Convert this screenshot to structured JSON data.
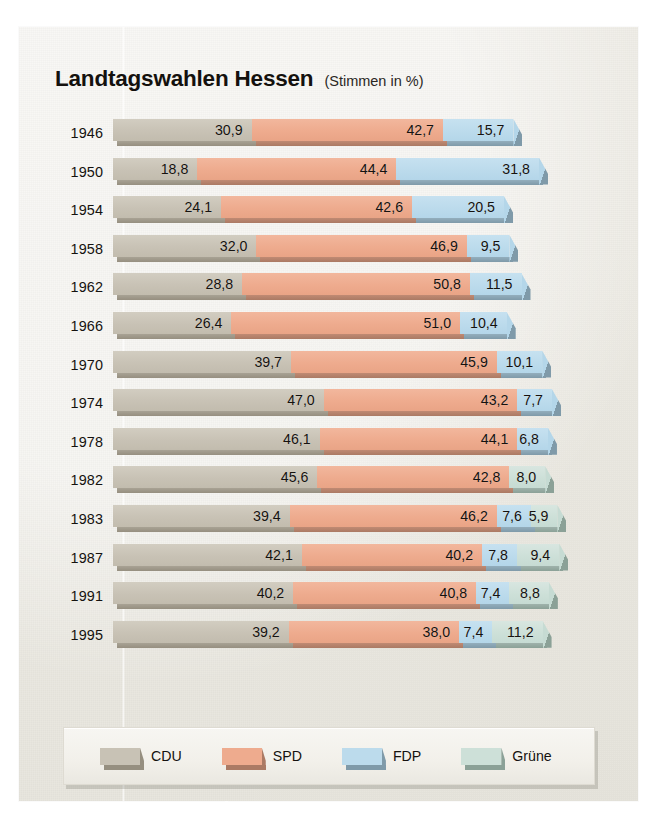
{
  "header": {
    "title": "Landtagswahlen Hessen",
    "subtitle": "(Stimmen in %)"
  },
  "legend": {
    "items": [
      {
        "label": "CDU",
        "key": "cdu",
        "color": "#c8c2b5"
      },
      {
        "label": "SPD",
        "key": "spd",
        "color": "#eeab8e"
      },
      {
        "label": "FDP",
        "key": "fdp",
        "color": "#bcdbec"
      },
      {
        "label": "Grüne",
        "key": "gru",
        "color": "#cde0d8"
      }
    ]
  },
  "chart_data": {
    "type": "bar",
    "orientation": "horizontal",
    "stacked": true,
    "title": "Landtagswahlen Hessen",
    "subtitle": "(Stimmen in %)",
    "xlabel": "",
    "ylabel": "",
    "xlim": [
      0,
      100
    ],
    "grid": false,
    "legend_position": "bottom",
    "value_format": "german-decimal-comma",
    "categories": [
      "1946",
      "1950",
      "1954",
      "1958",
      "1962",
      "1966",
      "1970",
      "1974",
      "1978",
      "1982",
      "1983",
      "1987",
      "1991",
      "1995"
    ],
    "series": [
      {
        "name": "CDU",
        "color": "#c8c2b5",
        "values": [
          30.9,
          18.8,
          24.1,
          32.0,
          28.8,
          26.4,
          39.7,
          47.0,
          46.1,
          45.6,
          39.4,
          42.1,
          40.2,
          39.2
        ]
      },
      {
        "name": "SPD",
        "color": "#eeab8e",
        "values": [
          42.7,
          44.4,
          42.6,
          46.9,
          50.8,
          51.0,
          45.9,
          43.2,
          44.1,
          42.8,
          46.2,
          40.2,
          40.8,
          38.0
        ]
      },
      {
        "name": "FDP",
        "color": "#bcdbec",
        "values": [
          15.7,
          31.8,
          20.5,
          9.5,
          11.5,
          10.4,
          10.1,
          7.7,
          6.8,
          null,
          7.6,
          7.8,
          7.4,
          7.4
        ]
      },
      {
        "name": "Grüne",
        "color": "#cde0d8",
        "values": [
          null,
          null,
          null,
          null,
          null,
          null,
          null,
          null,
          null,
          8.0,
          5.9,
          9.4,
          8.8,
          11.2
        ]
      }
    ],
    "rows": [
      {
        "year": "1946",
        "cells": [
          {
            "party": "CDU",
            "label": "30,9",
            "value": 30.9
          },
          {
            "party": "SPD",
            "label": "42,7",
            "value": 42.7
          },
          {
            "party": "FDP",
            "label": "15,7",
            "value": 15.7
          }
        ]
      },
      {
        "year": "1950",
        "cells": [
          {
            "party": "CDU",
            "label": "18,8",
            "value": 18.8
          },
          {
            "party": "SPD",
            "label": "44,4",
            "value": 44.4
          },
          {
            "party": "FDP",
            "label": "31,8",
            "value": 31.8
          }
        ]
      },
      {
        "year": "1954",
        "cells": [
          {
            "party": "CDU",
            "label": "24,1",
            "value": 24.1
          },
          {
            "party": "SPD",
            "label": "42,6",
            "value": 42.6
          },
          {
            "party": "FDP",
            "label": "20,5",
            "value": 20.5
          }
        ]
      },
      {
        "year": "1958",
        "cells": [
          {
            "party": "CDU",
            "label": "32,0",
            "value": 32.0
          },
          {
            "party": "SPD",
            "label": "46,9",
            "value": 46.9
          },
          {
            "party": "FDP",
            "label": "9,5",
            "value": 9.5
          }
        ]
      },
      {
        "year": "1962",
        "cells": [
          {
            "party": "CDU",
            "label": "28,8",
            "value": 28.8
          },
          {
            "party": "SPD",
            "label": "50,8",
            "value": 50.8
          },
          {
            "party": "FDP",
            "label": "11,5",
            "value": 11.5
          }
        ]
      },
      {
        "year": "1966",
        "cells": [
          {
            "party": "CDU",
            "label": "26,4",
            "value": 26.4
          },
          {
            "party": "SPD",
            "label": "51,0",
            "value": 51.0
          },
          {
            "party": "FDP",
            "label": "10,4",
            "value": 10.4
          }
        ]
      },
      {
        "year": "1970",
        "cells": [
          {
            "party": "CDU",
            "label": "39,7",
            "value": 39.7
          },
          {
            "party": "SPD",
            "label": "45,9",
            "value": 45.9
          },
          {
            "party": "FDP",
            "label": "10,1",
            "value": 10.1
          }
        ]
      },
      {
        "year": "1974",
        "cells": [
          {
            "party": "CDU",
            "label": "47,0",
            "value": 47.0
          },
          {
            "party": "SPD",
            "label": "43,2",
            "value": 43.2
          },
          {
            "party": "FDP",
            "label": "7,7",
            "value": 7.7
          }
        ]
      },
      {
        "year": "1978",
        "cells": [
          {
            "party": "CDU",
            "label": "46,1",
            "value": 46.1
          },
          {
            "party": "SPD",
            "label": "44,1",
            "value": 44.1
          },
          {
            "party": "FDP",
            "label": "6,8",
            "value": 6.8
          }
        ]
      },
      {
        "year": "1982",
        "cells": [
          {
            "party": "CDU",
            "label": "45,6",
            "value": 45.6
          },
          {
            "party": "SPD",
            "label": "42,8",
            "value": 42.8
          },
          {
            "party": "Grüne",
            "label": "8,0",
            "value": 8.0
          }
        ]
      },
      {
        "year": "1983",
        "cells": [
          {
            "party": "CDU",
            "label": "39,4",
            "value": 39.4
          },
          {
            "party": "SPD",
            "label": "46,2",
            "value": 46.2
          },
          {
            "party": "FDP",
            "label": "7,6",
            "value": 7.6
          },
          {
            "party": "Grüne",
            "label": "5,9",
            "value": 5.9
          }
        ]
      },
      {
        "year": "1987",
        "cells": [
          {
            "party": "CDU",
            "label": "42,1",
            "value": 42.1
          },
          {
            "party": "SPD",
            "label": "40,2",
            "value": 40.2
          },
          {
            "party": "FDP",
            "label": "7,8",
            "value": 7.8
          },
          {
            "party": "Grüne",
            "label": "9,4",
            "value": 9.4
          }
        ]
      },
      {
        "year": "1991",
        "cells": [
          {
            "party": "CDU",
            "label": "40,2",
            "value": 40.2
          },
          {
            "party": "SPD",
            "label": "40,8",
            "value": 40.8
          },
          {
            "party": "FDP",
            "label": "7,4",
            "value": 7.4
          },
          {
            "party": "Grüne",
            "label": "8,8",
            "value": 8.8
          }
        ]
      },
      {
        "year": "1995",
        "cells": [
          {
            "party": "CDU",
            "label": "39,2",
            "value": 39.2
          },
          {
            "party": "SPD",
            "label": "38,0",
            "value": 38.0
          },
          {
            "party": "FDP",
            "label": "7,4",
            "value": 7.4
          },
          {
            "party": "Grüne",
            "label": "11,2",
            "value": 11.2
          }
        ]
      }
    ]
  }
}
